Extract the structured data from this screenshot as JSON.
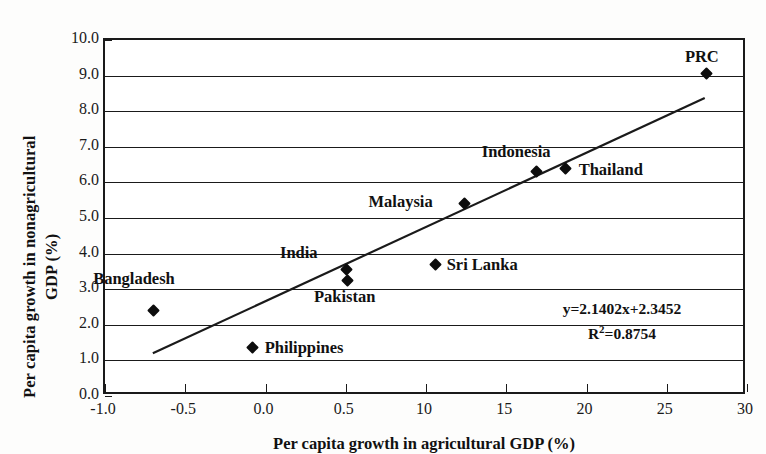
{
  "chart_data": {
    "type": "scatter",
    "title": "",
    "xlabel": "Per capita growth in agricultural GDP (%)",
    "ylabel_line1": "Per capita growth in nonagricultural",
    "ylabel_line2": "GDP (%)",
    "xlim": [
      -1.0,
      30
    ],
    "ylim": [
      0.0,
      10.0
    ],
    "grid": true,
    "legend_position": "none",
    "xticks": [
      "-1.0",
      "-0.5",
      "0.0",
      "0.5",
      "10",
      "15",
      "20",
      "25",
      "30"
    ],
    "xtick_values": [
      -1.0,
      -0.5,
      0.0,
      0.5,
      10,
      15,
      20,
      25,
      30
    ],
    "yticks": [
      "0.0",
      "1.0",
      "2.0",
      "3.0",
      "4.0",
      "5.0",
      "6.0",
      "7.0",
      "8.0",
      "9.0",
      "10.0"
    ],
    "ytick_values": [
      0.0,
      1.0,
      2.0,
      3.0,
      4.0,
      5.0,
      6.0,
      7.0,
      8.0,
      9.0,
      10.0
    ],
    "points": [
      {
        "name": "Bangladesh",
        "x": -0.7,
        "y": 2.4,
        "label_dx": -60,
        "label_dy": -41
      },
      {
        "name": "Philippines",
        "x": -0.08,
        "y": 1.35,
        "label_dx": 12,
        "label_dy": -9
      },
      {
        "name": "India",
        "x": 0.53,
        "y": 3.55,
        "label_dx": -66,
        "label_dy": -26
      },
      {
        "name": "Pakistan",
        "x": 0.76,
        "y": 3.25,
        "label_dx": -34,
        "label_dy": 8
      },
      {
        "name": "Sri Lanka",
        "x": 10.6,
        "y": 3.68,
        "label_dx": 11,
        "label_dy": -9
      },
      {
        "name": "Malaysia",
        "x": 12.4,
        "y": 5.42,
        "label_dx": -96,
        "label_dy": -10
      },
      {
        "name": "Indonesia",
        "x": 16.9,
        "y": 6.3,
        "label_dx": -55,
        "label_dy": -29
      },
      {
        "name": "Thailand",
        "x": 18.7,
        "y": 6.4,
        "label_dx": 13,
        "label_dy": -7
      },
      {
        "name": "PRC",
        "x": 27.5,
        "y": 9.05,
        "label_dx": -22,
        "label_dy": -26
      }
    ],
    "trendline": {
      "equation": "y=2.1402x+2.3452",
      "r_squared_label": "R",
      "r_squared_sup": "2",
      "r_squared_value": "=0.8754",
      "r_squared": 0.8754,
      "slope": 2.1402,
      "intercept": 2.3452,
      "x_start": -0.7,
      "y_start": 1.1,
      "x_end": 27.6,
      "y_end": 8.35
    },
    "colors": {
      "marker": "#0d0d0d",
      "line": "#1a1a1a",
      "axis": "#1a1a1a",
      "background": "#ffffff"
    }
  }
}
